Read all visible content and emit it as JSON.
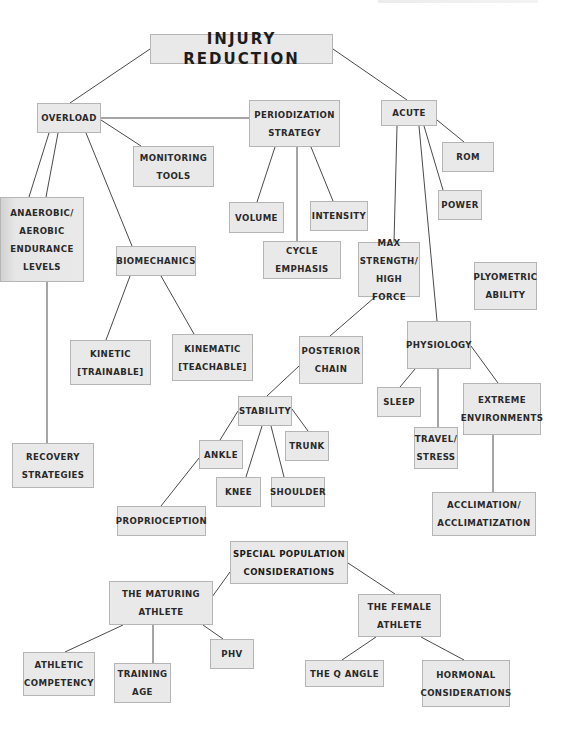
{
  "diagram": {
    "title": "INJURY REDUCTION",
    "colors": {
      "node_fill": "#e9e9e9",
      "node_border": "#b5b5b5",
      "line": "#4a4a4a",
      "text": "#2a2a2a",
      "background": "#ffffff"
    },
    "nodes": [
      {
        "id": "injury_reduction",
        "label": "INJURY REDUCTION",
        "x": 150,
        "y": 34,
        "w": 183,
        "h": 30,
        "kind": "root"
      },
      {
        "id": "overload",
        "label": "OVERLOAD",
        "x": 37,
        "y": 103,
        "w": 64,
        "h": 30
      },
      {
        "id": "periodization",
        "label": "PERIODIZATION\nSTRATEGY",
        "x": 249,
        "y": 100,
        "w": 91,
        "h": 47
      },
      {
        "id": "acute",
        "label": "ACUTE",
        "x": 381,
        "y": 100,
        "w": 56,
        "h": 26
      },
      {
        "id": "rom",
        "label": "ROM",
        "x": 442,
        "y": 142,
        "w": 52,
        "h": 30
      },
      {
        "id": "monitoring_tools",
        "label": "MONITORING\nTOOLS",
        "x": 133,
        "y": 146,
        "w": 81,
        "h": 41
      },
      {
        "id": "power",
        "label": "POWER",
        "x": 438,
        "y": 190,
        "w": 44,
        "h": 30
      },
      {
        "id": "volume",
        "label": "VOLUME",
        "x": 229,
        "y": 202,
        "w": 55,
        "h": 31
      },
      {
        "id": "intensity",
        "label": "INTENSITY",
        "x": 310,
        "y": 201,
        "w": 58,
        "h": 30
      },
      {
        "id": "anaerobic",
        "label": "ANAEROBIC/\nAEROBIC\nENDURANCE\nLEVELS",
        "x": 0,
        "y": 197,
        "w": 84,
        "h": 85,
        "kind": "shaded"
      },
      {
        "id": "biomechanics",
        "label": "BIOMECHANICS",
        "x": 116,
        "y": 246,
        "w": 80,
        "h": 30
      },
      {
        "id": "cycle_emphasis",
        "label": "CYCLE\nEMPHASIS",
        "x": 263,
        "y": 241,
        "w": 78,
        "h": 38
      },
      {
        "id": "max_strength",
        "label": "MAX\nSTRENGTH/\nHIGH FORCE",
        "x": 358,
        "y": 242,
        "w": 62,
        "h": 55
      },
      {
        "id": "plyometric",
        "label": "PLYOMETRIC\nABILITY",
        "x": 474,
        "y": 262,
        "w": 63,
        "h": 48
      },
      {
        "id": "kinetic",
        "label": "KINETIC\n[TRAINABLE]",
        "x": 70,
        "y": 340,
        "w": 81,
        "h": 45
      },
      {
        "id": "kinematic",
        "label": "KINEMATIC\n[TEACHABLE]",
        "x": 172,
        "y": 334,
        "w": 81,
        "h": 47
      },
      {
        "id": "posterior_chain",
        "label": "POSTERIOR\nCHAIN",
        "x": 299,
        "y": 336,
        "w": 64,
        "h": 48
      },
      {
        "id": "physiology",
        "label": "PHYSIOLOGY",
        "x": 407,
        "y": 321,
        "w": 64,
        "h": 48
      },
      {
        "id": "stability",
        "label": "STABILITY",
        "x": 238,
        "y": 396,
        "w": 54,
        "h": 30
      },
      {
        "id": "sleep",
        "label": "SLEEP",
        "x": 377,
        "y": 387,
        "w": 44,
        "h": 30
      },
      {
        "id": "extreme_env",
        "label": "EXTREME\nENVIRONMENTS",
        "x": 463,
        "y": 383,
        "w": 78,
        "h": 52
      },
      {
        "id": "trunk",
        "label": "TRUNK",
        "x": 285,
        "y": 431,
        "w": 44,
        "h": 30
      },
      {
        "id": "ankle",
        "label": "ANKLE",
        "x": 199,
        "y": 440,
        "w": 44,
        "h": 29
      },
      {
        "id": "travel_stress",
        "label": "TRAVEL/\nSTRESS",
        "x": 414,
        "y": 427,
        "w": 44,
        "h": 42
      },
      {
        "id": "recovery",
        "label": "RECOVERY\nSTRATEGIES",
        "x": 12,
        "y": 443,
        "w": 82,
        "h": 45
      },
      {
        "id": "knee",
        "label": "KNEE",
        "x": 216,
        "y": 477,
        "w": 45,
        "h": 30
      },
      {
        "id": "shoulder",
        "label": "SHOULDER",
        "x": 271,
        "y": 477,
        "w": 54,
        "h": 30
      },
      {
        "id": "acclimation",
        "label": "ACCLIMATION/\nACCLIMATIZATION",
        "x": 432,
        "y": 492,
        "w": 104,
        "h": 44
      },
      {
        "id": "proprioception",
        "label": "PROPRIOCEPTION",
        "x": 117,
        "y": 506,
        "w": 89,
        "h": 30
      },
      {
        "id": "special_population",
        "label": "SPECIAL POPULATION\nCONSIDERATIONS",
        "x": 230,
        "y": 541,
        "w": 118,
        "h": 43,
        "kind": "special"
      },
      {
        "id": "maturing_athlete",
        "label": "THE MATURING\nATHLETE",
        "x": 109,
        "y": 581,
        "w": 104,
        "h": 44
      },
      {
        "id": "female_athlete",
        "label": "THE FEMALE\nATHLETE",
        "x": 358,
        "y": 594,
        "w": 83,
        "h": 43
      },
      {
        "id": "phv",
        "label": "PHV",
        "x": 210,
        "y": 639,
        "w": 44,
        "h": 30
      },
      {
        "id": "athletic_competency",
        "label": "ATHLETIC\nCOMPETENCY",
        "x": 23,
        "y": 652,
        "w": 72,
        "h": 44
      },
      {
        "id": "training_age",
        "label": "TRAINING\nAGE",
        "x": 114,
        "y": 663,
        "w": 57,
        "h": 40
      },
      {
        "id": "q_angle",
        "label": "THE Q ANGLE",
        "x": 305,
        "y": 660,
        "w": 79,
        "h": 27
      },
      {
        "id": "hormonal",
        "label": "HORMONAL\nCONSIDERATIONS",
        "x": 422,
        "y": 660,
        "w": 88,
        "h": 47
      }
    ],
    "edges": [
      {
        "from": "injury_reduction",
        "to": "overload",
        "x1": 150,
        "y1": 49,
        "x2": 70,
        "y2": 103
      },
      {
        "from": "injury_reduction",
        "to": "acute",
        "x1": 333,
        "y1": 49,
        "x2": 407,
        "y2": 100
      },
      {
        "from": "overload",
        "to": "periodization",
        "x1": 101,
        "y1": 118,
        "x2": 249,
        "y2": 118
      },
      {
        "from": "overload",
        "to": "monitoring_tools",
        "x1": 101,
        "y1": 120,
        "x2": 141,
        "y2": 146
      },
      {
        "from": "overload",
        "to": "anaerobic",
        "x1": 49,
        "y1": 133,
        "x2": 29,
        "y2": 197
      },
      {
        "from": "overload",
        "to": "anaerobic",
        "x1": 58,
        "y1": 133,
        "x2": 46,
        "y2": 197
      },
      {
        "from": "overload",
        "to": "biomechanics",
        "x1": 86,
        "y1": 133,
        "x2": 132,
        "y2": 246
      },
      {
        "from": "periodization",
        "to": "volume",
        "x1": 275,
        "y1": 147,
        "x2": 257,
        "y2": 202
      },
      {
        "from": "periodization",
        "to": "cycle_emphasis",
        "x1": 297,
        "y1": 147,
        "x2": 297,
        "y2": 241
      },
      {
        "from": "periodization",
        "to": "intensity",
        "x1": 311,
        "y1": 147,
        "x2": 333,
        "y2": 201
      },
      {
        "from": "acute",
        "to": "rom",
        "x1": 437,
        "y1": 120,
        "x2": 464,
        "y2": 142
      },
      {
        "from": "acute",
        "to": "power",
        "x1": 424,
        "y1": 126,
        "x2": 443,
        "y2": 190
      },
      {
        "from": "acute",
        "to": "max_strength",
        "x1": 397,
        "y1": 126,
        "x2": 394,
        "y2": 242
      },
      {
        "from": "acute",
        "to": "physiology",
        "x1": 419,
        "y1": 126,
        "x2": 437,
        "y2": 321
      },
      {
        "from": "anaerobic",
        "to": "recovery",
        "x1": 47,
        "y1": 282,
        "x2": 47,
        "y2": 443
      },
      {
        "from": "biomechanics",
        "to": "kinetic",
        "x1": 130,
        "y1": 276,
        "x2": 106,
        "y2": 340
      },
      {
        "from": "biomechanics",
        "to": "kinematic",
        "x1": 161,
        "y1": 276,
        "x2": 194,
        "y2": 334
      },
      {
        "from": "max_strength",
        "to": "posterior_chain",
        "x1": 375,
        "y1": 297,
        "x2": 330,
        "y2": 336
      },
      {
        "from": "posterior_chain",
        "to": "stability",
        "x1": 299,
        "y1": 366,
        "x2": 267,
        "y2": 396
      },
      {
        "from": "physiology",
        "to": "sleep",
        "x1": 415,
        "y1": 369,
        "x2": 400,
        "y2": 387
      },
      {
        "from": "physiology",
        "to": "travel_stress",
        "x1": 438,
        "y1": 369,
        "x2": 438,
        "y2": 427
      },
      {
        "from": "physiology",
        "to": "extreme_env",
        "x1": 471,
        "y1": 346,
        "x2": 498,
        "y2": 383
      },
      {
        "from": "extreme_env",
        "to": "acclimation",
        "x1": 493,
        "y1": 435,
        "x2": 493,
        "y2": 492
      },
      {
        "from": "stability",
        "to": "ankle",
        "x1": 238,
        "y1": 411,
        "x2": 220,
        "y2": 440
      },
      {
        "from": "stability",
        "to": "knee",
        "x1": 262,
        "y1": 426,
        "x2": 246,
        "y2": 477
      },
      {
        "from": "stability",
        "to": "shoulder",
        "x1": 271,
        "y1": 426,
        "x2": 284,
        "y2": 477
      },
      {
        "from": "stability",
        "to": "trunk",
        "x1": 292,
        "y1": 409,
        "x2": 308,
        "y2": 431
      },
      {
        "from": "ankle",
        "to": "proprioception",
        "x1": 199,
        "y1": 458,
        "x2": 161,
        "y2": 506
      },
      {
        "from": "special_population",
        "to": "maturing_athlete",
        "x1": 230,
        "y1": 572,
        "x2": 212,
        "y2": 597
      },
      {
        "from": "special_population",
        "to": "female_athlete",
        "x1": 348,
        "y1": 563,
        "x2": 395,
        "y2": 594
      },
      {
        "from": "maturing_athlete",
        "to": "athletic_competency",
        "x1": 123,
        "y1": 625,
        "x2": 65,
        "y2": 652
      },
      {
        "from": "maturing_athlete",
        "to": "training_age",
        "x1": 153,
        "y1": 625,
        "x2": 153,
        "y2": 663
      },
      {
        "from": "maturing_athlete",
        "to": "phv",
        "x1": 203,
        "y1": 625,
        "x2": 223,
        "y2": 639
      },
      {
        "from": "female_athlete",
        "to": "q_angle",
        "x1": 376,
        "y1": 637,
        "x2": 342,
        "y2": 660
      },
      {
        "from": "female_athlete",
        "to": "hormonal",
        "x1": 421,
        "y1": 637,
        "x2": 464,
        "y2": 660
      }
    ]
  }
}
